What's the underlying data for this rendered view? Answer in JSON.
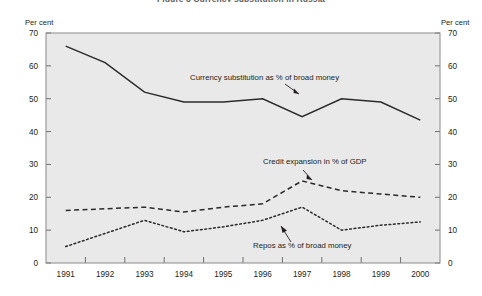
{
  "figure": {
    "title": "Figure 3   Currency substitution in Russia",
    "unit_label_left": "Per cent",
    "unit_label_right": "Per cent"
  },
  "chart_data": {
    "type": "line",
    "title": "Figure 3   Currency substitution in Russia",
    "xlabel": "",
    "ylabel": "Per cent",
    "ylim": [
      0,
      70
    ],
    "yticks": [
      0,
      10,
      20,
      30,
      40,
      50,
      60,
      70
    ],
    "grid": false,
    "legend": "annotations-inline",
    "categories": [
      "1991",
      "1992",
      "1993",
      "1994",
      "1995",
      "1996",
      "1997",
      "1998",
      "1999",
      "2000"
    ],
    "series": [
      {
        "name": "Currency substitution as % of broad money",
        "style": "solid",
        "values": [
          66,
          61,
          52,
          49,
          49,
          50,
          44.5,
          50,
          49,
          43.5
        ]
      },
      {
        "name": "Credit expansion in % of GDP",
        "style": "dashed",
        "values": [
          16,
          16.5,
          17,
          15.5,
          17,
          18,
          25,
          22,
          21,
          20
        ]
      },
      {
        "name": "Repos as % of broad money",
        "style": "dotted",
        "values": [
          5,
          9,
          13,
          9.5,
          11,
          13,
          17,
          10,
          11.5,
          12.5
        ]
      }
    ],
    "annotations": [
      {
        "text": "Currency substitution as % of broad money",
        "points_to_year": "1996"
      },
      {
        "text": "Credit expansion in % of GDP",
        "points_to_year": "1997"
      },
      {
        "text": "Repos as % of broad money",
        "points_to_year": "1997"
      }
    ]
  },
  "axis": {
    "y_tick_labels": [
      "70",
      "60",
      "50",
      "40",
      "30",
      "20",
      "10",
      "0"
    ],
    "x_tick_labels": [
      "1991",
      "1992",
      "1993",
      "1994",
      "1995",
      "1996",
      "1997",
      "1998",
      "1999",
      "2000"
    ]
  },
  "colors": {
    "plot_background": "#e9e9e9",
    "frame": "#8a8a8a",
    "series": "#2b2b2b",
    "text": "#231f20"
  }
}
